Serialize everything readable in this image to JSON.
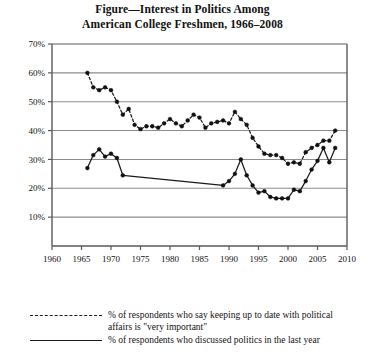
{
  "title": {
    "line1": "Figure—Interest in Politics Among",
    "line2": "American College Freshmen, 1966–2008"
  },
  "legend": {
    "series1_line1": "% of respondents who say keeping up to date with political",
    "series1_line2": "affairs is \"very important\"",
    "series2_line1": "% of respondents who discussed politics in the last year"
  },
  "colors": {
    "line": "#1a1a1a",
    "grid": "#8c8c8c",
    "axis": "#5a5a5a",
    "background": "#ffffff"
  },
  "chart_data": {
    "type": "line",
    "title": "Figure—Interest in Politics Among American College Freshmen, 1966–2008",
    "xlabel": "",
    "ylabel": "",
    "xlim": [
      1960,
      2010
    ],
    "ylim": [
      0,
      70
    ],
    "xticks": [
      1960,
      1965,
      1970,
      1975,
      1980,
      1985,
      1990,
      1995,
      2000,
      2005,
      2010
    ],
    "xticklabels": [
      "1960",
      "1965",
      "1970",
      "1975",
      "1980",
      "1985",
      "1990",
      "1995",
      "2000",
      "2005",
      "2010"
    ],
    "yticks": [
      10,
      20,
      30,
      40,
      50,
      60,
      70
    ],
    "yticklabels": [
      "10%",
      "20%",
      "30%",
      "40%",
      "50%",
      "60%",
      "70%"
    ],
    "grid": "horizontal",
    "legend_position": "below",
    "markers": "filled-circle",
    "series": [
      {
        "name": "% of respondents who say keeping up to date with political affairs is \"very important\"",
        "style": "dashed",
        "x": [
          1966,
          1967,
          1968,
          1969,
          1970,
          1971,
          1972,
          1973,
          1974,
          1975,
          1976,
          1977,
          1978,
          1979,
          1980,
          1981,
          1982,
          1983,
          1984,
          1985,
          1986,
          1987,
          1988,
          1989,
          1990,
          1991,
          1992,
          1993,
          1994,
          1995,
          1996,
          1997,
          1998,
          1999,
          2000,
          2001,
          2002,
          2003,
          2004,
          2005,
          2006,
          2007,
          2008
        ],
        "values": [
          60.0,
          55.0,
          54.0,
          55.0,
          54.0,
          50.0,
          45.5,
          47.5,
          42.0,
          40.5,
          41.5,
          41.5,
          41.0,
          42.5,
          44.0,
          42.5,
          41.5,
          43.5,
          45.5,
          44.5,
          41.0,
          42.5,
          43.0,
          43.5,
          42.5,
          46.5,
          44.0,
          42.0,
          37.5,
          34.5,
          32.0,
          31.5,
          31.5,
          30.5,
          28.5,
          29.0,
          28.5,
          32.5,
          34.0,
          35.0,
          36.5,
          36.5,
          40.0
        ]
      },
      {
        "name": "% of respondents who discussed politics in the last year",
        "style": "solid",
        "x": [
          1966,
          1967,
          1968,
          1969,
          1970,
          1971,
          1972,
          1989,
          1990,
          1991,
          1992,
          1993,
          1994,
          1995,
          1996,
          1997,
          1998,
          1999,
          2000,
          2001,
          2002,
          2003,
          2004,
          2005,
          2006,
          2007,
          2008
        ],
        "values": [
          27.0,
          31.5,
          33.5,
          31.0,
          32.0,
          30.5,
          24.5,
          21.0,
          22.5,
          25.0,
          30.0,
          24.5,
          21.0,
          18.5,
          19.0,
          17.0,
          16.5,
          16.5,
          16.5,
          19.5,
          19.0,
          22.5,
          26.5,
          29.5,
          34.0,
          29.0,
          34.0
        ]
      }
    ]
  }
}
